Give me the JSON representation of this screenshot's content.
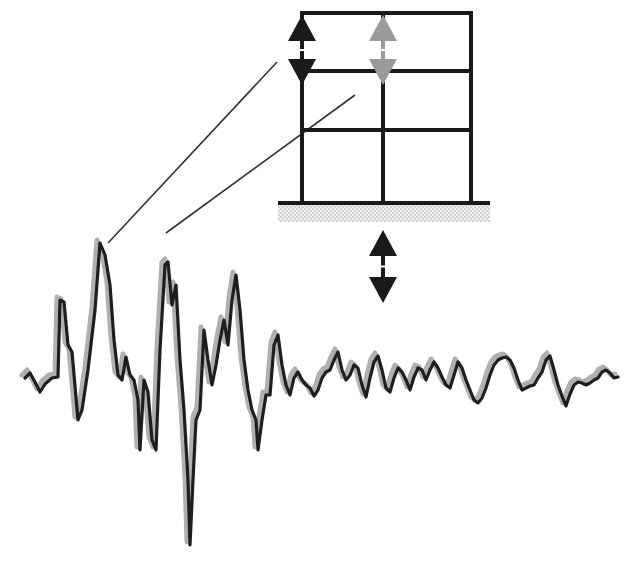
{
  "diagram": {
    "description": "Seismic ground motion record with building frame response",
    "colors": {
      "background": "#ffffff",
      "frame": "#1a1a1a",
      "ground_hatch": "#cfcfcf",
      "arrow_primary": "#1a1a1a",
      "arrow_secondary": "#9a9a9a",
      "wave_primary": "#1e1e1e",
      "wave_secondary": "#b0b0b0",
      "leader_line": "#333333"
    },
    "frame": {
      "bays": 2,
      "stories": 3,
      "columns_x": [
        302,
        383,
        471
      ],
      "floors_y": [
        13,
        71,
        130,
        203
      ],
      "ground": {
        "x1": 278,
        "x2": 490,
        "y": 203,
        "hatch_height": 17
      }
    },
    "arrows": [
      {
        "name": "roof-left-displacement",
        "x": 302,
        "y_top": 15,
        "y_bottom": 85,
        "style": "primary"
      },
      {
        "name": "roof-middle-displacement",
        "x": 383,
        "y_top": 15,
        "y_bottom": 85,
        "style": "secondary"
      },
      {
        "name": "ground-displacement",
        "x": 383,
        "y_top": 230,
        "y_bottom": 303,
        "style": "primary"
      }
    ],
    "leader_lines": [
      {
        "from": [
          277,
          62
        ],
        "to": [
          108,
          243
        ]
      },
      {
        "from": [
          355,
          95
        ],
        "to": [
          166,
          233
        ]
      }
    ],
    "waveform": {
      "baseline_y": 380,
      "x_range": [
        25,
        620
      ],
      "points_primary": [
        [
          25,
          378
        ],
        [
          30,
          373
        ],
        [
          35,
          382
        ],
        [
          40,
          392
        ],
        [
          45,
          384
        ],
        [
          52,
          378
        ],
        [
          58,
          377
        ],
        [
          60,
          300
        ],
        [
          64,
          302
        ],
        [
          68,
          345
        ],
        [
          72,
          352
        ],
        [
          78,
          420
        ],
        [
          82,
          410
        ],
        [
          88,
          370
        ],
        [
          95,
          310
        ],
        [
          100,
          243
        ],
        [
          105,
          255
        ],
        [
          110,
          285
        ],
        [
          114,
          340
        ],
        [
          118,
          375
        ],
        [
          122,
          380
        ],
        [
          126,
          357
        ],
        [
          130,
          375
        ],
        [
          134,
          380
        ],
        [
          138,
          400
        ],
        [
          140,
          450
        ],
        [
          144,
          380
        ],
        [
          148,
          392
        ],
        [
          152,
          440
        ],
        [
          156,
          450
        ],
        [
          160,
          350
        ],
        [
          165,
          265
        ],
        [
          168,
          262
        ],
        [
          172,
          305
        ],
        [
          176,
          285
        ],
        [
          180,
          360
        ],
        [
          184,
          410
        ],
        [
          188,
          480
        ],
        [
          190,
          545
        ],
        [
          193,
          480
        ],
        [
          196,
          420
        ],
        [
          200,
          410
        ],
        [
          204,
          330
        ],
        [
          208,
          360
        ],
        [
          212,
          385
        ],
        [
          216,
          365
        ],
        [
          220,
          340
        ],
        [
          224,
          320
        ],
        [
          228,
          345
        ],
        [
          232,
          300
        ],
        [
          236,
          275
        ],
        [
          240,
          310
        ],
        [
          244,
          360
        ],
        [
          248,
          390
        ],
        [
          252,
          410
        ],
        [
          256,
          420
        ],
        [
          258,
          450
        ],
        [
          262,
          420
        ],
        [
          266,
          395
        ],
        [
          270,
          395
        ],
        [
          274,
          345
        ],
        [
          278,
          335
        ],
        [
          282,
          365
        ],
        [
          286,
          385
        ],
        [
          290,
          395
        ],
        [
          294,
          378
        ],
        [
          298,
          372
        ],
        [
          302,
          380
        ],
        [
          306,
          385
        ],
        [
          310,
          388
        ],
        [
          314,
          396
        ],
        [
          318,
          390
        ],
        [
          322,
          378
        ],
        [
          326,
          372
        ],
        [
          330,
          370
        ],
        [
          334,
          360
        ],
        [
          338,
          352
        ],
        [
          342,
          370
        ],
        [
          346,
          380
        ],
        [
          350,
          375
        ],
        [
          354,
          365
        ],
        [
          358,
          368
        ],
        [
          362,
          385
        ],
        [
          366,
          397
        ],
        [
          370,
          378
        ],
        [
          374,
          362
        ],
        [
          378,
          356
        ],
        [
          382,
          370
        ],
        [
          386,
          388
        ],
        [
          390,
          392
        ],
        [
          394,
          378
        ],
        [
          398,
          368
        ],
        [
          402,
          372
        ],
        [
          406,
          380
        ],
        [
          410,
          390
        ],
        [
          414,
          377
        ],
        [
          418,
          368
        ],
        [
          422,
          370
        ],
        [
          426,
          380
        ],
        [
          430,
          370
        ],
        [
          434,
          362
        ],
        [
          438,
          368
        ],
        [
          442,
          377
        ],
        [
          446,
          385
        ],
        [
          450,
          388
        ],
        [
          454,
          375
        ],
        [
          458,
          362
        ],
        [
          462,
          368
        ],
        [
          466,
          380
        ],
        [
          470,
          390
        ],
        [
          474,
          400
        ],
        [
          478,
          403
        ],
        [
          482,
          398
        ],
        [
          486,
          388
        ],
        [
          490,
          375
        ],
        [
          494,
          365
        ],
        [
          498,
          360
        ],
        [
          502,
          358
        ],
        [
          506,
          357
        ],
        [
          510,
          360
        ],
        [
          514,
          368
        ],
        [
          518,
          380
        ],
        [
          522,
          390
        ],
        [
          526,
          388
        ],
        [
          530,
          386
        ],
        [
          534,
          385
        ],
        [
          538,
          378
        ],
        [
          542,
          372
        ],
        [
          546,
          360
        ],
        [
          550,
          356
        ],
        [
          554,
          370
        ],
        [
          558,
          385
        ],
        [
          562,
          396
        ],
        [
          566,
          406
        ],
        [
          570,
          394
        ],
        [
          574,
          385
        ],
        [
          578,
          382
        ],
        [
          582,
          383
        ],
        [
          586,
          385
        ],
        [
          590,
          383
        ],
        [
          594,
          380
        ],
        [
          598,
          378
        ],
        [
          602,
          372
        ],
        [
          606,
          370
        ],
        [
          610,
          373
        ],
        [
          614,
          378
        ],
        [
          618,
          377
        ]
      ]
    }
  }
}
